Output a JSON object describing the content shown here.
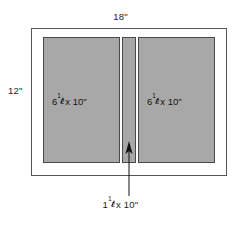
{
  "diagram": {
    "colors": {
      "panel_fill": "#a8a8a8",
      "panel_stroke": "#4a4a4a",
      "frame_stroke": "#555555",
      "background": "#ffffff",
      "text": "#1d1d1d",
      "leader": "#111111"
    },
    "overall": {
      "width_label": "18\"",
      "height_label": "12\""
    },
    "panels": [
      {
        "name": "left-panel",
        "whole": "6",
        "fraction_numerator": "1",
        "fraction_denominator": "2",
        "rest": "x 10\""
      },
      {
        "name": "right-panel",
        "whole": "6",
        "fraction_numerator": "1",
        "fraction_denominator": "2",
        "rest": "x 10\""
      }
    ],
    "center_strip": {
      "name": "center-strip",
      "whole": "1",
      "fraction_numerator": "1",
      "fraction_denominator": "2",
      "rest": "x 10\""
    },
    "geometry": {
      "frame": {
        "x": 31,
        "y": 28,
        "width": 196,
        "height": 148
      },
      "left_panel": {
        "x": 43,
        "y": 37,
        "width": 77,
        "height": 126
      },
      "center_strip": {
        "x": 122,
        "y": 37,
        "width": 14,
        "height": 126
      },
      "right_panel": {
        "x": 138,
        "y": 37,
        "width": 77,
        "height": 126
      },
      "leader": {
        "x": 129,
        "tip_y": 142,
        "tail_y": 196
      }
    }
  }
}
